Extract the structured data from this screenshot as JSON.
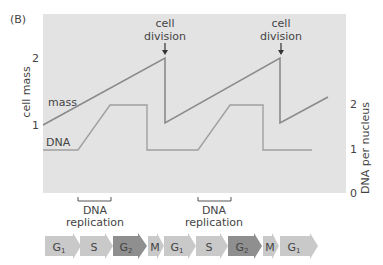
{
  "panel_label": "(B)",
  "y_left_label": "cell mass",
  "y_right_label": "DNA per nucleus",
  "left_ticks": [
    {
      "label": "2",
      "y": 58
    },
    {
      "label": "1",
      "y": 125
    }
  ],
  "right_ticks": [
    {
      "label": "2",
      "y": 104
    },
    {
      "label": "1",
      "y": 149
    },
    {
      "label": "0",
      "y": 193
    }
  ],
  "series": {
    "mass": "mass",
    "dna": "DNA"
  },
  "annotations": {
    "division1": {
      "line1": "cell",
      "line2": "division"
    },
    "division2": {
      "line1": "cell",
      "line2": "division"
    },
    "replication1": {
      "line1": "DNA",
      "line2": "replication"
    },
    "replication2": {
      "line1": "DNA",
      "line2": "replication"
    }
  },
  "phases": [
    {
      "label": "G",
      "sub": "1",
      "shade": "light"
    },
    {
      "label": "S",
      "sub": "",
      "shade": "light"
    },
    {
      "label": "G",
      "sub": "2",
      "shade": "dark"
    },
    {
      "label": "M",
      "sub": "",
      "shade": "light"
    },
    {
      "label": "G",
      "sub": "1",
      "shade": "light"
    },
    {
      "label": "S",
      "sub": "",
      "shade": "light"
    },
    {
      "label": "G",
      "sub": "2",
      "shade": "dark"
    },
    {
      "label": "M",
      "sub": "",
      "shade": "light"
    },
    {
      "label": "G",
      "sub": "1",
      "shade": "light"
    }
  ],
  "colors": {
    "plot_bg": "#e3e3e3",
    "line": "#8a8a8a",
    "arrow_light": "#c9c9c9",
    "arrow_dark": "#8f8f8f",
    "text": "#444444"
  }
}
